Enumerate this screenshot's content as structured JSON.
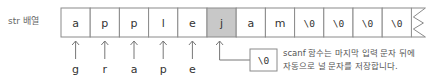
{
  "array_label": "str 배열",
  "cells": [
    {
      "value": "a",
      "highlight": false,
      "mono": false
    },
    {
      "value": "p",
      "highlight": false,
      "mono": false
    },
    {
      "value": "p",
      "highlight": false,
      "mono": false
    },
    {
      "value": "l",
      "highlight": false,
      "mono": false
    },
    {
      "value": "e",
      "highlight": false,
      "mono": false
    },
    {
      "value": "j",
      "highlight": true,
      "mono": false
    },
    {
      "value": "a",
      "highlight": false,
      "mono": false
    },
    {
      "value": "m",
      "highlight": false,
      "mono": false
    },
    {
      "value": "\\0",
      "highlight": false,
      "mono": true
    },
    {
      "value": "\\0",
      "highlight": false,
      "mono": true
    },
    {
      "value": "\\0",
      "highlight": false,
      "mono": true
    },
    {
      "value": "\\0",
      "highlight": false,
      "mono": true
    }
  ],
  "input_arrows": [
    {
      "cell_index": 0,
      "label": "g"
    },
    {
      "cell_index": 1,
      "label": "r"
    },
    {
      "cell_index": 2,
      "label": "a"
    },
    {
      "cell_index": 3,
      "label": "p"
    },
    {
      "cell_index": 4,
      "label": "e"
    }
  ],
  "null_callout": {
    "cell_index": 5,
    "box_text": "\\0",
    "note_lines": [
      "scanf 함수는 마지막 입력 문자 뒤에",
      "자동으로 널 문자를 저장합니다."
    ]
  },
  "colors": {
    "border": "#8a8a8a",
    "highlight_fill": "#c8c8c8",
    "arrow": "#777777",
    "text": "#333333"
  }
}
